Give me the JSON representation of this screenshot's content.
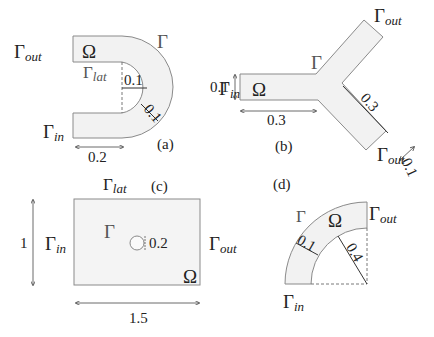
{
  "panels": {
    "a": {
      "tag": "(a)",
      "omega": "Ω",
      "gamma": "Γ",
      "gamma_out": {
        "base": "Γ",
        "sub": "out"
      },
      "gamma_in": {
        "base": "Γ",
        "sub": "in"
      },
      "gamma_lat": {
        "base": "Γ",
        "sub": "lat"
      },
      "inner_radius": "0.1",
      "channel_width": "0.1",
      "inlet_length": "0.2"
    },
    "b": {
      "tag": "(b)",
      "omega": "Ω",
      "gamma": "Γ",
      "gamma_in": {
        "base": "Γ",
        "sub": "in"
      },
      "gamma_out_top": {
        "base": "Γ",
        "sub": "out"
      },
      "gamma_out_bottom": {
        "base": "Γ",
        "sub": "out"
      },
      "inlet_width": "0.1",
      "stem_length": "0.3",
      "arm_length": "0.3",
      "outlet_width": "0.1"
    },
    "c": {
      "tag": "(c)",
      "omega": "Ω",
      "gamma": "Γ",
      "gamma_lat": {
        "base": "Γ",
        "sub": "lat"
      },
      "gamma_in": {
        "base": "Γ",
        "sub": "in"
      },
      "gamma_out": {
        "base": "Γ",
        "sub": "out"
      },
      "height": "1",
      "width": "1.5",
      "cylinder_diameter": "0.2"
    },
    "d": {
      "tag": "(d)",
      "omega": "Ω",
      "gamma": "Γ",
      "gamma_in": {
        "base": "Γ",
        "sub": "in"
      },
      "gamma_out": {
        "base": "Γ",
        "sub": "out"
      },
      "thickness": "0.1",
      "inner_radius": "0.4"
    }
  },
  "colors": {
    "fill": "#f2f2f2",
    "stroke": "#8a8a8a",
    "text": "#222222"
  }
}
